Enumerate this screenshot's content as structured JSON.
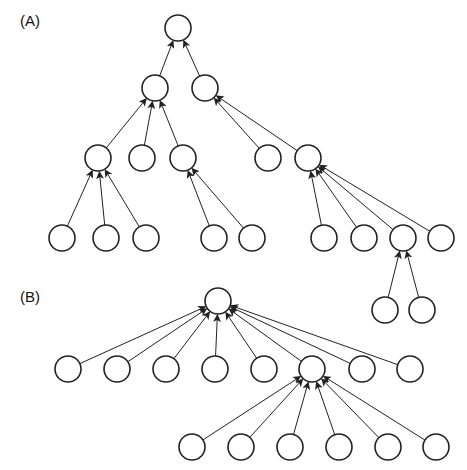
{
  "panels": [
    {
      "label": "(A)",
      "label_pos": [
        20,
        12
      ]
    },
    {
      "label": "(B)",
      "label_pos": [
        20,
        288
      ]
    }
  ],
  "style": {
    "stroke": "#222222",
    "node_fill": "#ffffff",
    "radius": 13
  },
  "nodes": {
    "a0": [
      178,
      28
    ],
    "a1": [
      155,
      88
    ],
    "a2": [
      205,
      88
    ],
    "a3": [
      98,
      158
    ],
    "a4": [
      142,
      158
    ],
    "a5": [
      183,
      158
    ],
    "a6": [
      268,
      158
    ],
    "a7": [
      308,
      158
    ],
    "a8": [
      62,
      238
    ],
    "a9": [
      106,
      238
    ],
    "a10": [
      146,
      238
    ],
    "a11": [
      214,
      238
    ],
    "a12": [
      252,
      238
    ],
    "a13": [
      324,
      238
    ],
    "a14": [
      364,
      238
    ],
    "a15": [
      403,
      238
    ],
    "a16": [
      441,
      238
    ],
    "a17": [
      385,
      310
    ],
    "a18": [
      422,
      310
    ],
    "b0": [
      218,
      301
    ],
    "b1": [
      68,
      369
    ],
    "b2": [
      117,
      369
    ],
    "b3": [
      166,
      369
    ],
    "b4": [
      215,
      369
    ],
    "b5": [
      264,
      369
    ],
    "b6": [
      312,
      369
    ],
    "b7": [
      362,
      369
    ],
    "b8": [
      410,
      369
    ],
    "b9": [
      192,
      447
    ],
    "b10": [
      241,
      447
    ],
    "b11": [
      290,
      447
    ],
    "b12": [
      339,
      447
    ],
    "b13": [
      388,
      447
    ],
    "b14": [
      436,
      447
    ]
  },
  "edges": [
    [
      "a1",
      "a0"
    ],
    [
      "a2",
      "a0"
    ],
    [
      "a3",
      "a1"
    ],
    [
      "a4",
      "a1"
    ],
    [
      "a5",
      "a1"
    ],
    [
      "a6",
      "a2"
    ],
    [
      "a7",
      "a2"
    ],
    [
      "a8",
      "a3"
    ],
    [
      "a9",
      "a3"
    ],
    [
      "a10",
      "a3"
    ],
    [
      "a11",
      "a5"
    ],
    [
      "a12",
      "a5"
    ],
    [
      "a13",
      "a7"
    ],
    [
      "a14",
      "a7"
    ],
    [
      "a15",
      "a7"
    ],
    [
      "a16",
      "a7"
    ],
    [
      "a17",
      "a15"
    ],
    [
      "a18",
      "a15"
    ],
    [
      "b1",
      "b0"
    ],
    [
      "b2",
      "b0"
    ],
    [
      "b3",
      "b0"
    ],
    [
      "b4",
      "b0"
    ],
    [
      "b5",
      "b0"
    ],
    [
      "b6",
      "b0"
    ],
    [
      "b7",
      "b0"
    ],
    [
      "b8",
      "b0"
    ],
    [
      "b9",
      "b6"
    ],
    [
      "b10",
      "b6"
    ],
    [
      "b11",
      "b6"
    ],
    [
      "b12",
      "b6"
    ],
    [
      "b13",
      "b6"
    ],
    [
      "b14",
      "b6"
    ]
  ]
}
